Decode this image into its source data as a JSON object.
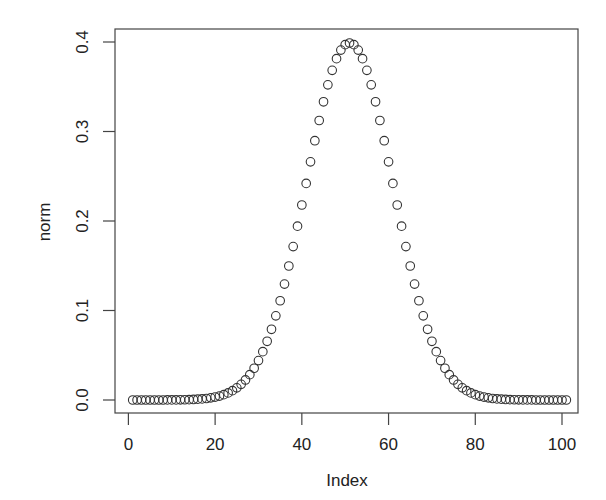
{
  "chart_data": {
    "type": "scatter",
    "title": "",
    "xlabel": "Index",
    "ylabel": "norm",
    "xlim": [
      1,
      101
    ],
    "ylim": [
      0,
      0.4
    ],
    "x_ticks": [
      0,
      20,
      40,
      60,
      80,
      100
    ],
    "x_tick_labels": [
      "0",
      "20",
      "40",
      "60",
      "80",
      "100"
    ],
    "y_ticks": [
      0.0,
      0.1,
      0.2,
      0.3,
      0.4
    ],
    "y_tick_labels": [
      "0.0",
      "0.1",
      "0.2",
      "0.3",
      "0.4"
    ],
    "grid": false,
    "legend": null,
    "marker": "open-circle",
    "marker_color": "#333333",
    "series": [
      {
        "name": "norm",
        "x": [
          1,
          2,
          3,
          4,
          5,
          6,
          7,
          8,
          9,
          10,
          11,
          12,
          13,
          14,
          15,
          16,
          17,
          18,
          19,
          20,
          21,
          22,
          23,
          24,
          25,
          26,
          27,
          28,
          29,
          30,
          31,
          32,
          33,
          34,
          35,
          36,
          37,
          38,
          39,
          40,
          41,
          42,
          43,
          44,
          45,
          46,
          47,
          48,
          49,
          50,
          51,
          52,
          53,
          54,
          55,
          56,
          57,
          58,
          59,
          60,
          61,
          62,
          63,
          64,
          65,
          66,
          67,
          68,
          69,
          70,
          71,
          72,
          73,
          74,
          75,
          76,
          77,
          78,
          79,
          80,
          81,
          82,
          83,
          84,
          85,
          86,
          87,
          88,
          89,
          90,
          91,
          92,
          93,
          94,
          95,
          96,
          97,
          98,
          99,
          100,
          101
        ],
        "values": [
          0.0,
          0.0,
          0.0,
          0.0,
          0.0,
          0.0,
          0.0,
          0.0,
          0.0001,
          0.0001,
          0.0001,
          0.0002,
          0.0003,
          0.0004,
          0.0006,
          0.0009,
          0.0012,
          0.0017,
          0.0024,
          0.0033,
          0.0044,
          0.006,
          0.0079,
          0.0104,
          0.0136,
          0.0175,
          0.0224,
          0.0283,
          0.0355,
          0.044,
          0.054,
          0.0656,
          0.079,
          0.094,
          0.1109,
          0.1295,
          0.1497,
          0.1714,
          0.1942,
          0.2179,
          0.242,
          0.2661,
          0.2897,
          0.3123,
          0.3332,
          0.3521,
          0.3683,
          0.3814,
          0.391,
          0.397,
          0.3989,
          0.397,
          0.391,
          0.3814,
          0.3683,
          0.3521,
          0.3332,
          0.3123,
          0.2897,
          0.2661,
          0.242,
          0.2179,
          0.1942,
          0.1714,
          0.1497,
          0.1295,
          0.1109,
          0.094,
          0.079,
          0.0656,
          0.054,
          0.044,
          0.0355,
          0.0283,
          0.0224,
          0.0175,
          0.0136,
          0.0104,
          0.0079,
          0.006,
          0.0044,
          0.0033,
          0.0024,
          0.0017,
          0.0012,
          0.0009,
          0.0006,
          0.0004,
          0.0003,
          0.0002,
          0.0001,
          0.0001,
          0.0001,
          0.0,
          0.0,
          0.0,
          0.0,
          0.0,
          0.0,
          0.0,
          0.0
        ]
      }
    ]
  }
}
